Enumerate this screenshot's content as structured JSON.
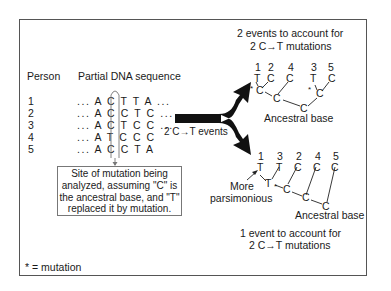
{
  "left_panel": {
    "header_person": "Person",
    "header_sequence": "Partial DNA sequence",
    "persons": [
      {
        "id": "1",
        "sequence": "... A C T T A ..."
      },
      {
        "id": "2",
        "sequence": "... A C C T C ..."
      },
      {
        "id": "3",
        "sequence": "... A C T C C ..."
      },
      {
        "id": "4",
        "sequence": "... A T C C C"
      },
      {
        "id": "5",
        "sequence": "... A C C T A"
      }
    ],
    "callout_lines": [
      "Site of mutation being",
      "analyzed, assuming \"C\" is",
      "the ancestral base, and \"T\"",
      "replaced it by mutation."
    ],
    "legend": "* = mutation"
  },
  "arrow": {
    "label": "2 C→T events"
  },
  "top_tree": {
    "caption_line1": "2 events to account for",
    "caption_line2": "2 C→T mutations",
    "leaf_labels": [
      "1",
      "2",
      "4",
      "3",
      "5"
    ],
    "leaf_bases": [
      "T",
      "C",
      "C",
      "T",
      "C"
    ],
    "ancestral_label": "Ancestral base"
  },
  "bottom_tree": {
    "leaf_labels": [
      "1",
      "3",
      "2",
      "4",
      "5"
    ],
    "leaf_bases": [
      "T",
      "T",
      "C",
      "C",
      "C"
    ],
    "note_line1": "More",
    "note_line2": "parsimonious",
    "ancestral_label": "Ancestral base",
    "caption_line1": "1 event to account for",
    "caption_line2": "2 C→T mutations"
  },
  "mutation_marker": "*"
}
